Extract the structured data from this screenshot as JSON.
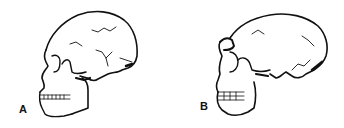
{
  "figures": [
    {
      "label": "A",
      "subject": "skull-lateral-view-rounded-vault"
    },
    {
      "label": "B",
      "subject": "skull-lateral-view-elongated-vault-brow-ridge"
    }
  ],
  "colors": {
    "line": "#111111",
    "background": "#ffffff"
  }
}
